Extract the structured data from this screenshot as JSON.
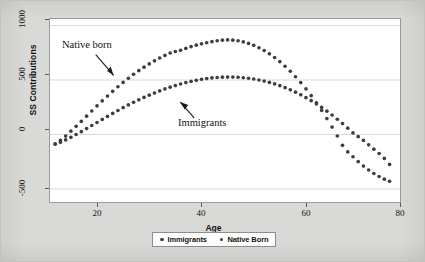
{
  "chart_data": {
    "type": "scatter",
    "title": "",
    "xlabel": "Age",
    "ylabel": "SS Contributions",
    "xlim": [
      15,
      82
    ],
    "ylim": [
      -620,
      1060
    ],
    "xticks": [
      20,
      40,
      60,
      80
    ],
    "yticks": [
      1000,
      500,
      0,
      -500
    ],
    "grid": true,
    "grid_axis": "y",
    "legend_position": "bottom-center",
    "marker_color": "#3d3d3d",
    "plot_background": "#ffffff",
    "figure_background": "#d9d9d7",
    "annotations": [
      {
        "text": "Native born",
        "x": 27,
        "y": 700,
        "arrow_to_x": 34,
        "arrow_to_y": 470
      },
      {
        "text": "Immigrants",
        "x": 44,
        "y": 180,
        "arrow_to_x": 38,
        "arrow_to_y": 420
      }
    ],
    "series": [
      {
        "name": "Native Born",
        "legend_label": "Native Born",
        "x": [
          16,
          17,
          18,
          19,
          20,
          21,
          22,
          23,
          24,
          25,
          26,
          27,
          28,
          29,
          30,
          31,
          32,
          33,
          34,
          35,
          36,
          37,
          38,
          39,
          40,
          41,
          42,
          43,
          44,
          45,
          46,
          47,
          48,
          49,
          50,
          51,
          52,
          53,
          54,
          55,
          56,
          57,
          58,
          59,
          60,
          61,
          62,
          63,
          64,
          65,
          66,
          67,
          68,
          69,
          70,
          71,
          72,
          73,
          74,
          75,
          76,
          77,
          78,
          79,
          80
        ],
        "values": [
          -85,
          -55,
          -15,
          30,
          75,
          120,
          168,
          215,
          262,
          308,
          352,
          396,
          438,
          478,
          516,
          552,
          586,
          618,
          648,
          676,
          702,
          726,
          748,
          762,
          772,
          790,
          806,
          820,
          832,
          842,
          852,
          860,
          866,
          868,
          866,
          860,
          850,
          836,
          818,
          796,
          770,
          740,
          706,
          668,
          626,
          580,
          530,
          476,
          418,
          356,
          290,
          220,
          146,
          68,
          -14,
          -100,
          -160,
          -205,
          -250,
          -290,
          -326,
          -358,
          -386,
          -410,
          -430
        ]
      },
      {
        "name": "Immigrants",
        "legend_label": "Immigrants",
        "x": [
          16,
          17,
          18,
          19,
          20,
          21,
          22,
          23,
          24,
          25,
          26,
          27,
          28,
          29,
          30,
          31,
          32,
          33,
          34,
          35,
          36,
          37,
          38,
          39,
          40,
          41,
          42,
          43,
          44,
          45,
          46,
          47,
          48,
          49,
          50,
          51,
          52,
          53,
          54,
          55,
          56,
          57,
          58,
          59,
          60,
          61,
          62,
          63,
          64,
          65,
          66,
          67,
          68,
          69,
          70,
          71,
          72,
          73,
          74,
          75,
          76,
          77,
          78,
          79,
          80
        ],
        "values": [
          -90,
          -72,
          -50,
          -26,
          0,
          26,
          54,
          82,
          110,
          138,
          166,
          193,
          220,
          246,
          271,
          295,
          318,
          340,
          361,
          381,
          400,
          418,
          434,
          449,
          463,
          476,
          487,
          497,
          506,
          513,
          519,
          523,
          526,
          527,
          527,
          525,
          521,
          516,
          509,
          500,
          490,
          478,
          464,
          448,
          430,
          410,
          388,
          364,
          338,
          310,
          280,
          248,
          214,
          178,
          140,
          100,
          58,
          14,
          -20,
          -55,
          -95,
          -135,
          -175,
          -220,
          -275
        ]
      }
    ]
  },
  "axes": {
    "ytick_labels": [
      "1000",
      "500",
      "0",
      "-500"
    ],
    "xtick_labels": [
      "20",
      "40",
      "60",
      "80"
    ],
    "ylabel": "SS Contributions",
    "xlabel": "Age"
  },
  "annotations": {
    "native_born": "Native born",
    "immigrants": "Immigrants"
  },
  "legend": {
    "entries": [
      {
        "label": "Immigrants"
      },
      {
        "label": "Native Born"
      }
    ]
  }
}
